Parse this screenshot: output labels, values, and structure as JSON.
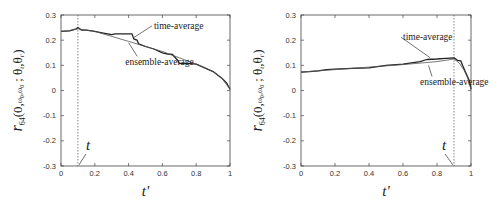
{
  "chart_data": [
    {
      "type": "line",
      "panel": "left",
      "xlabel": "t'",
      "ylabel": "r_64(0, ω0, ω0 ; θt, θt')",
      "xlim": [
        0,
        1
      ],
      "ylim": [
        -0.3,
        0.3
      ],
      "xticks": [
        "0",
        "0.2",
        "0.4",
        "0.6",
        "0.8",
        "1"
      ],
      "yticks": [
        "-0.3",
        "-0.2",
        "-0.1",
        "0",
        "0.1",
        "0.2",
        "0.3"
      ],
      "marker": {
        "label": "t",
        "x": 0.1
      },
      "annotations": [
        {
          "text": "time-average",
          "x": 0.55,
          "y": 0.245,
          "arrow_to": [
            0.43,
            0.21
          ]
        },
        {
          "text": "ensemble-average",
          "x": 0.38,
          "y": 0.1,
          "arrow_to": [
            0.4,
            0.19
          ]
        }
      ],
      "series": [
        {
          "name": "time-average",
          "x": [
            0,
            0.05,
            0.09,
            0.1,
            0.12,
            0.15,
            0.2,
            0.25,
            0.3,
            0.32,
            0.35,
            0.42,
            0.43,
            0.45,
            0.46,
            0.5,
            0.55,
            0.6,
            0.63,
            0.66,
            0.69,
            0.7,
            0.75,
            0.8,
            0.85,
            0.9,
            0.95,
            0.98,
            1.0
          ],
          "y": [
            0.235,
            0.237,
            0.245,
            0.25,
            0.24,
            0.24,
            0.235,
            0.228,
            0.222,
            0.225,
            0.225,
            0.225,
            0.205,
            0.2,
            0.185,
            0.175,
            0.165,
            0.15,
            0.145,
            0.143,
            0.12,
            0.108,
            0.108,
            0.105,
            0.09,
            0.075,
            0.05,
            0.03,
            0.005
          ]
        },
        {
          "name": "ensemble-average",
          "x": [
            0,
            0.05,
            0.1,
            0.2,
            0.3,
            0.4,
            0.5,
            0.6,
            0.7,
            0.8,
            0.9,
            0.95,
            1.0
          ],
          "y": [
            0.235,
            0.238,
            0.245,
            0.235,
            0.215,
            0.195,
            0.175,
            0.155,
            0.13,
            0.105,
            0.075,
            0.05,
            0.005
          ]
        }
      ]
    },
    {
      "type": "line",
      "panel": "right",
      "xlabel": "t'",
      "ylabel": "r_64(0, ω0, ω0 ; θt, θt')",
      "xlim": [
        0,
        1
      ],
      "ylim": [
        -0.3,
        0.3
      ],
      "xticks": [
        "0",
        "0.2",
        "0.4",
        "0.6",
        "0.8",
        "1"
      ],
      "yticks": [
        "-0.3",
        "-0.2",
        "-0.1",
        "0",
        "0.1",
        "0.2",
        "0.3"
      ],
      "marker": {
        "label": "t",
        "x": 0.9
      },
      "annotations": [
        {
          "text": "time-average",
          "x": 0.6,
          "y": 0.2,
          "arrow_to": [
            0.76,
            0.13
          ]
        },
        {
          "text": "ensemble-average",
          "x": 0.7,
          "y": 0.02,
          "arrow_to": [
            0.75,
            0.1
          ]
        }
      ],
      "series": [
        {
          "name": "time-average",
          "x": [
            0,
            0.05,
            0.1,
            0.15,
            0.2,
            0.3,
            0.4,
            0.45,
            0.5,
            0.6,
            0.65,
            0.7,
            0.74,
            0.8,
            0.85,
            0.9,
            0.92,
            0.94,
            0.95,
            0.97,
            0.99,
            1.0
          ],
          "y": [
            0.073,
            0.075,
            0.078,
            0.083,
            0.085,
            0.088,
            0.09,
            0.095,
            0.1,
            0.105,
            0.11,
            0.115,
            0.123,
            0.125,
            0.128,
            0.13,
            0.12,
            0.118,
            0.1,
            0.07,
            0.04,
            0.005
          ]
        },
        {
          "name": "ensemble-average",
          "x": [
            0,
            0.2,
            0.4,
            0.6,
            0.8,
            0.9,
            0.93,
            0.96,
            0.98,
            1.0
          ],
          "y": [
            0.073,
            0.083,
            0.093,
            0.103,
            0.115,
            0.125,
            0.11,
            0.08,
            0.05,
            0.005
          ]
        }
      ]
    }
  ]
}
